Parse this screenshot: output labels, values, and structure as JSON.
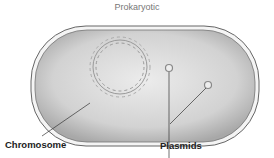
{
  "title": "Prokaryotic",
  "labels": {
    "chromosome": "Chromosome",
    "plasmids": "Plasmids"
  },
  "colors": {
    "cell_fill": "#c8c8c8",
    "outline": "#555555",
    "dna": "#9a9a9a",
    "text": "#222222"
  }
}
